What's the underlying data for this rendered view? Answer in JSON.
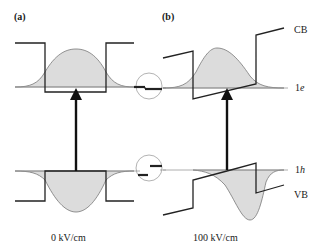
{
  "figure": {
    "panels": [
      {
        "id": "a",
        "label": "(a)",
        "field_caption": "0 kV/cm"
      },
      {
        "id": "b",
        "label": "(b)",
        "field_caption": "100 kV/cm"
      }
    ],
    "band_labels": {
      "cb": "CB",
      "vb": "VB",
      "electron_level_num": "1",
      "electron_level_sym": "e",
      "hole_level_num": "1",
      "hole_level_sym": "h"
    },
    "colors": {
      "line": "#222222",
      "wavefunction_fill": "#dcdcdc",
      "wavefunction_outline": "#777777",
      "level_line": "#999999",
      "circle": "#aaaaaa"
    }
  }
}
